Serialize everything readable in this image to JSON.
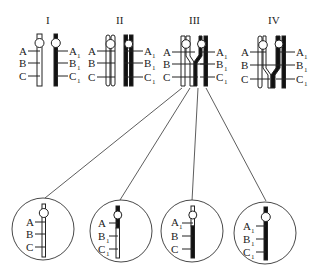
{
  "diagram": {
    "stages": [
      {
        "id": "I",
        "label": "I",
        "left_genes": [
          "A",
          "B",
          "C"
        ],
        "right_genes": [
          "A",
          "B",
          "C"
        ],
        "right_sub": "1"
      },
      {
        "id": "II",
        "label": "II",
        "left_genes": [
          "A",
          "B",
          "C"
        ],
        "right_genes": [
          "A",
          "B",
          "C"
        ],
        "right_sub": "1"
      },
      {
        "id": "III",
        "label": "III",
        "left_genes": [
          "A",
          "B",
          "C"
        ],
        "right_genes": [
          "A",
          "B",
          "C"
        ],
        "right_sub": "1"
      },
      {
        "id": "IV",
        "label": "IV",
        "left_genes": [
          "A",
          "B",
          "C"
        ],
        "right_genes": [
          "A",
          "B",
          "C"
        ],
        "right_sub": "1"
      }
    ],
    "products": [
      {
        "genes": [
          "A",
          "B",
          "C"
        ],
        "subs": [
          "",
          "",
          ""
        ],
        "type": "parental-white"
      },
      {
        "genes": [
          "A",
          "B",
          "C"
        ],
        "subs": [
          "",
          "1",
          "1"
        ],
        "type": "recombinant"
      },
      {
        "genes": [
          "A",
          "B",
          "C"
        ],
        "subs": [
          "1",
          "",
          ""
        ],
        "type": "recombinant"
      },
      {
        "genes": [
          "A",
          "B",
          "C"
        ],
        "subs": [
          "1",
          "1",
          "1"
        ],
        "type": "parental-black"
      }
    ],
    "colors": {
      "line": "#222222",
      "fill_dark": "#111111",
      "fill_light": "#ffffff"
    }
  }
}
